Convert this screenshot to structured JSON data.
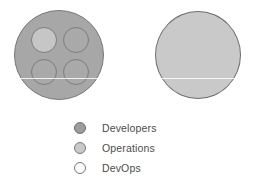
{
  "diagram": {
    "shapes": {
      "developers_circle": {
        "name": "Developers",
        "fill": "#a7a7a7",
        "stroke": "#787878",
        "inner_circles": [
          {
            "position": "top-left",
            "fill": "#c6c6c6",
            "stroke": "#7d7d7d",
            "role": "DevOps"
          },
          {
            "position": "top-right",
            "fill": "#a9a9a9",
            "stroke": "#7d7d7d",
            "role": "DevOps"
          },
          {
            "position": "bottom-left",
            "fill": "#a9a9a9",
            "stroke": "#7d7d7d",
            "role": "DevOps"
          },
          {
            "position": "bottom-right",
            "fill": "#a9a9a9",
            "stroke": "#7d7d7d",
            "role": "DevOps"
          }
        ]
      },
      "operations_circle": {
        "name": "Operations",
        "fill": "#c9c9c9",
        "stroke": "#6f6f6f",
        "inner_circles": []
      }
    }
  },
  "legend": {
    "items": [
      {
        "label": "Developers",
        "color": "#9d9d9d",
        "border": "#6e6e6e"
      },
      {
        "label": "Operations",
        "color": "#c9c9c9",
        "border": "#7a7a7a"
      },
      {
        "label": "DevOps",
        "color": "#fdfdfd",
        "border": "#7a7a7a"
      }
    ]
  },
  "chart_data": {
    "type": "diagram",
    "categories": [
      "Developers",
      "Operations",
      "DevOps"
    ],
    "groups": [
      {
        "name": "Developers",
        "shape": "circle",
        "contains": [
          "DevOps",
          "DevOps",
          "DevOps",
          "DevOps"
        ]
      },
      {
        "name": "Operations",
        "shape": "circle",
        "contains": []
      }
    ],
    "legend_position": "bottom-center"
  }
}
